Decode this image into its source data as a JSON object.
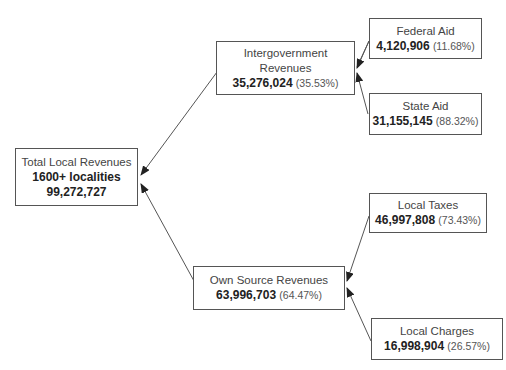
{
  "diagram": {
    "nodes": {
      "total": {
        "title": "Total Local Revenues",
        "subtitle": "1600+ localities",
        "amount": "99,272,727"
      },
      "intergov": {
        "title_line1": "Intergovernment",
        "title_line2": "Revenues",
        "amount": "35,276,024",
        "pct": "(35.53%)"
      },
      "federal": {
        "title": "Federal Aid",
        "amount": "4,120,906",
        "pct": "(11.68%)"
      },
      "state": {
        "title": "State Aid",
        "amount": "31,155,145",
        "pct": "(88.32%)"
      },
      "own": {
        "title": "Own Source Revenues",
        "amount": "63,996,703",
        "pct": "(64.47%)"
      },
      "taxes": {
        "title": "Local Taxes",
        "amount": "46,997,808",
        "pct": "(73.43%)"
      },
      "charges": {
        "title": "Local Charges",
        "amount": "16,998,904",
        "pct": "(26.57%)"
      }
    },
    "edges": [
      {
        "from": "intergov",
        "to": "total"
      },
      {
        "from": "own",
        "to": "total"
      },
      {
        "from": "federal",
        "to": "intergov"
      },
      {
        "from": "state",
        "to": "intergov"
      },
      {
        "from": "taxes",
        "to": "own"
      },
      {
        "from": "charges",
        "to": "own"
      }
    ],
    "colors": {
      "line": "#555555",
      "arrow": "#222222",
      "border": "#555555"
    }
  }
}
